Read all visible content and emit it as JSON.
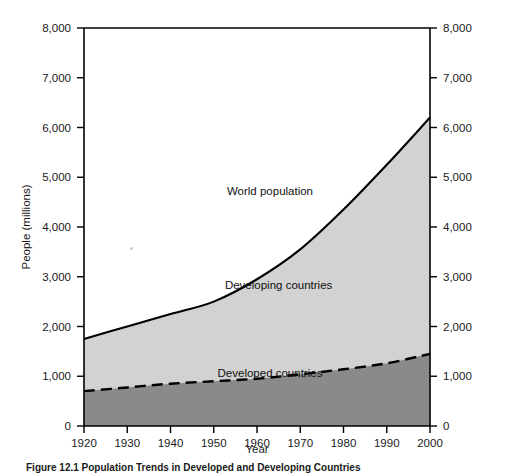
{
  "figure": {
    "caption": "Figure 12.1  Population Trends in Developed and Developing Countries"
  },
  "chart_data": {
    "type": "area",
    "title": "",
    "xlabel": "Year",
    "ylabel": "People (millions)",
    "xlim": [
      1920,
      2000
    ],
    "ylim": [
      0,
      8000
    ],
    "grid": false,
    "legend_position": "inline-annotations",
    "x": [
      1920,
      1930,
      1940,
      1950,
      1960,
      1970,
      1980,
      1990,
      2000
    ],
    "xticks": [
      "1920",
      "1930",
      "1940",
      "1950",
      "1960",
      "1970",
      "1980",
      "1990",
      "2000"
    ],
    "yticks": [
      "0",
      "1,000",
      "2,000",
      "3,000",
      "4,000",
      "5,000",
      "6,000",
      "7,000",
      "8,000"
    ],
    "ytick_values": [
      0,
      1000,
      2000,
      3000,
      4000,
      5000,
      6000,
      7000,
      8000
    ],
    "right_axis_yticks": [
      "0",
      "1,000",
      "2,000",
      "3,000",
      "4,000",
      "5,000",
      "6,000",
      "7,000",
      "8,000"
    ],
    "series": [
      {
        "name": "World population",
        "label": "World population",
        "style": "solid",
        "fill": "#d2d2d2",
        "values": [
          1750,
          2000,
          2250,
          2500,
          2950,
          3550,
          4350,
          5250,
          6200
        ]
      },
      {
        "name": "Developed countries",
        "label": "Developed countries",
        "style": "dashed",
        "fill": "#8a8a8a",
        "values": [
          700,
          775,
          850,
          900,
          950,
          1040,
          1140,
          1260,
          1450
        ]
      }
    ],
    "annotations": [
      {
        "text": "World population",
        "x": 1963,
        "y": 4650
      },
      {
        "text": "Developing countries",
        "x": 1965,
        "y": 2750
      },
      {
        "text": "Developed countries",
        "x": 1963,
        "y": 990
      }
    ],
    "colors": {
      "developing_fill": "#d2d2d2",
      "developed_fill": "#8a8a8a",
      "line": "#000000",
      "background": "#ffffff"
    }
  }
}
